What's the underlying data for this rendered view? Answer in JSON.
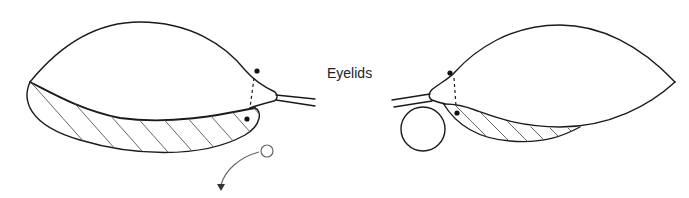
{
  "diagram": {
    "label": "Eyelids",
    "figures": [
      {
        "name": "left-eye",
        "components": [
          "upper-globe-outline",
          "lower-eyelid-hatched",
          "lacrimal-tip",
          "canaliculus-lines",
          "punctum-dot-upper",
          "punctum-dot-lower",
          "dashed-line",
          "small-circle",
          "curved-arrow"
        ]
      },
      {
        "name": "right-eye",
        "components": [
          "upper-globe-outline",
          "lower-eyelid-hatched",
          "lacrimal-tip",
          "canaliculus-lines",
          "punctum-dot-upper",
          "punctum-dot-lower",
          "dashed-line",
          "large-circle"
        ]
      }
    ],
    "colors": {
      "line": "#1a1a1a",
      "hatch": "#555555",
      "background": "#ffffff"
    }
  }
}
